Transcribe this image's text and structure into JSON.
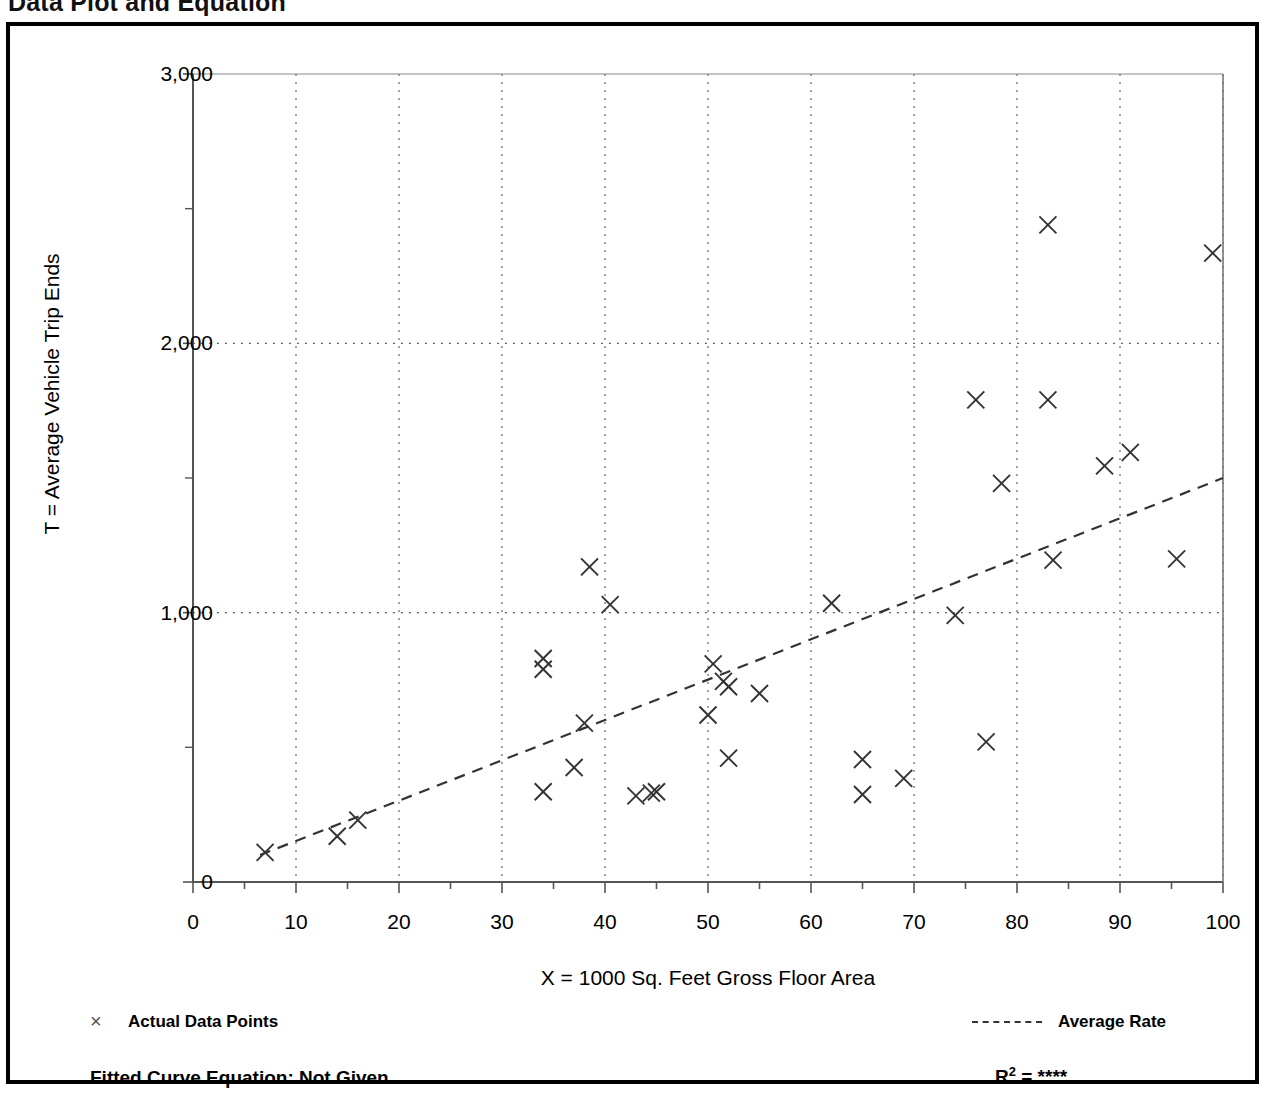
{
  "page": {
    "title": "Data Plot and Equation"
  },
  "legend": {
    "data_points_marker": "×",
    "data_points_label": "Actual Data Points",
    "average_rate_label": "Average Rate",
    "equation_label": "Fitted Curve Equation:  Not Given",
    "r2_prefix": "R",
    "r2_exponent": "2",
    "r2_value": "= ****"
  },
  "chart_data": {
    "type": "scatter",
    "title": "Data Plot and Equation",
    "xlabel": "X = 1000 Sq. Feet Gross Floor Area",
    "ylabel": "T = Average Vehicle Trip Ends",
    "xlim": [
      0,
      100
    ],
    "ylim": [
      0,
      3000
    ],
    "xticks": [
      0,
      10,
      20,
      30,
      40,
      50,
      60,
      70,
      80,
      90,
      100
    ],
    "xtick_labels": [
      "0",
      "10",
      "20",
      "30",
      "40",
      "50",
      "60",
      "70",
      "80",
      "90",
      "100"
    ],
    "yticks": [
      0,
      1000,
      2000,
      3000
    ],
    "ytick_labels": [
      "0",
      "1,000",
      "2,000",
      "3,000"
    ],
    "y_minor_ticks": [
      500,
      1500,
      2500
    ],
    "x_minor_tick_step": 5,
    "grid": "dotted-major",
    "grid_color": "#666666",
    "marker": "x",
    "marker_color": "#333333",
    "legend_position": "below-plot",
    "series": [
      {
        "name": "Actual Data Points",
        "points": [
          [
            7,
            110
          ],
          [
            14,
            170
          ],
          [
            16,
            230
          ],
          [
            34,
            830
          ],
          [
            34,
            790
          ],
          [
            34,
            335
          ],
          [
            37,
            425
          ],
          [
            38,
            590
          ],
          [
            38.5,
            1170
          ],
          [
            40.5,
            1030
          ],
          [
            43,
            320
          ],
          [
            44.5,
            330
          ],
          [
            45,
            335
          ],
          [
            50,
            620
          ],
          [
            50.5,
            810
          ],
          [
            51.5,
            745
          ],
          [
            52,
            725
          ],
          [
            52,
            460
          ],
          [
            55,
            700
          ],
          [
            62,
            1035
          ],
          [
            65,
            325
          ],
          [
            65,
            455
          ],
          [
            69,
            385
          ],
          [
            74,
            990
          ],
          [
            76,
            1790
          ],
          [
            77,
            520
          ],
          [
            78.5,
            1480
          ],
          [
            83,
            2440
          ],
          [
            83,
            1790
          ],
          [
            83.5,
            1195
          ],
          [
            88.5,
            1545
          ],
          [
            91,
            1595
          ],
          [
            95.5,
            1200
          ],
          [
            99,
            2335
          ]
        ]
      }
    ],
    "trendline": {
      "name": "Average Rate",
      "style": "dashed",
      "color": "#333333",
      "x_start": 6.5,
      "y_start": 100,
      "x_end": 100,
      "y_end": 1500
    }
  }
}
